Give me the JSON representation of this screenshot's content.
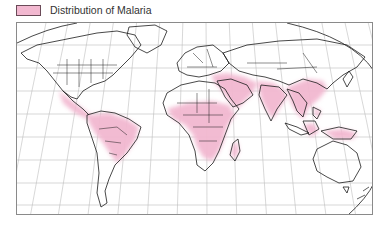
{
  "legend": {
    "label": "Distribution of Malaria",
    "swatch_color": "#f2b8d0"
  },
  "map": {
    "projection": "Robinson-style world map",
    "graticule": true,
    "colors": {
      "land_fill": "#ffffff",
      "border": "#1a1a1a",
      "graticule": "#b8b8b8",
      "malaria": "#f2b8d0"
    },
    "malaria_regions": [
      "Central America and Mexico",
      "Northern and Central South America (Amazon basin)",
      "Sub-Saharan Africa",
      "Madagascar",
      "Arabian Peninsula (southwest coast)",
      "Middle East / Iran / Afghanistan / Pakistan",
      "Indian subcontinent",
      "Southern China and Southeast Asia",
      "Indonesia, Philippines and Papua New Guinea"
    ]
  }
}
